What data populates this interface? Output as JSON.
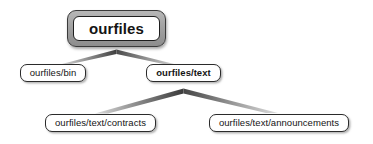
{
  "diagram": {
    "type": "directory-hierarchy-tree",
    "background_color": "#ffffff",
    "nodes": [
      {
        "id": "root",
        "label": "ourfiles",
        "level": 0,
        "emphasis": "root-double-frame",
        "bold": true,
        "border_color": "#1e1e1e",
        "frame_color": "#a2a2a2",
        "fill_color": "#ffffff"
      },
      {
        "id": "bin",
        "label": "ourfiles/bin",
        "level": 1,
        "emphasis": "normal",
        "bold": false,
        "border_color": "#2b2b2b",
        "fill_color": "#ffffff"
      },
      {
        "id": "text",
        "label": "ourfiles/text",
        "level": 1,
        "emphasis": "highlighted",
        "bold": true,
        "border_color": "#2b2b2b",
        "fill_color": "#ffffff"
      },
      {
        "id": "contracts",
        "label": "ourfiles/text/contracts",
        "level": 2,
        "emphasis": "normal",
        "bold": false,
        "border_color": "#2b2b2b",
        "fill_color": "#ffffff"
      },
      {
        "id": "announcements",
        "label": "ourfiles/text/announcements",
        "level": 2,
        "emphasis": "normal",
        "bold": false,
        "border_color": "#2b2b2b",
        "fill_color": "#ffffff"
      }
    ],
    "connectors": [
      {
        "id": "root-to-children",
        "name": "chevron-connector-root",
        "from": "root",
        "to": [
          "bin",
          "text"
        ],
        "shape": "chevron",
        "gradient_from": "#cfcfcf",
        "gradient_to": "#4a4a4a"
      },
      {
        "id": "text-to-children",
        "name": "chevron-connector-text",
        "from": "text",
        "to": [
          "contracts",
          "announcements"
        ],
        "shape": "chevron",
        "gradient_from": "#cfcfcf",
        "gradient_to": "#4a4a4a"
      }
    ]
  }
}
